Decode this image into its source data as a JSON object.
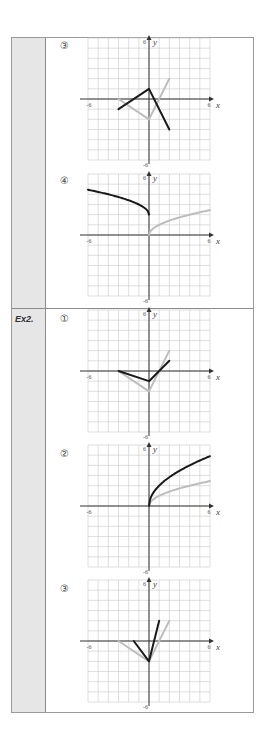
{
  "rows": [
    {
      "label": "",
      "problems": [
        {
          "number": "③",
          "graph_index": 0
        },
        {
          "number": "④",
          "graph_index": 1
        }
      ]
    },
    {
      "label": "Ex2.",
      "problems": [
        {
          "number": "①",
          "graph_index": 2
        },
        {
          "number": "②",
          "graph_index": 3
        },
        {
          "number": "③",
          "graph_index": 4
        }
      ]
    }
  ],
  "axis": {
    "min_label": "-6",
    "max_label": "6",
    "x_label": "x",
    "y_label": "y"
  },
  "colors": {
    "transformed": "#1a1a1a",
    "original": "#bdbdbd",
    "grid": "#c9c9c9",
    "label_bg": "#e6e6e6"
  },
  "chart_data": [
    {
      "type": "line",
      "title": "③",
      "xlim": [
        -6,
        6
      ],
      "ylim": [
        -6,
        6
      ],
      "grid": true,
      "xlabel": "x",
      "ylabel": "y",
      "series": [
        {
          "name": "transformed",
          "color": "#1a1a1a",
          "points": [
            [
              -3,
              -1
            ],
            [
              0,
              1
            ],
            [
              2,
              -3
            ]
          ]
        },
        {
          "name": "original",
          "color": "#bdbdbd",
          "points": [
            [
              -3,
              0
            ],
            [
              0,
              -2
            ],
            [
              1,
              0
            ],
            [
              2,
              2
            ]
          ]
        }
      ]
    },
    {
      "type": "line",
      "title": "④",
      "xlim": [
        -6,
        6
      ],
      "ylim": [
        -6,
        6
      ],
      "grid": true,
      "xlabel": "x",
      "ylabel": "y",
      "series": [
        {
          "name": "transformed",
          "color": "#1a1a1a",
          "function": "y = sqrt(-x) + 2",
          "domain": [
            -6,
            0
          ],
          "points": [
            [
              -6,
              4.45
            ],
            [
              -5,
              4.24
            ],
            [
              -4,
              4
            ],
            [
              -3,
              3.73
            ],
            [
              -2,
              3.41
            ],
            [
              -1,
              3
            ],
            [
              -0.5,
              2.71
            ],
            [
              -0.1,
              2.32
            ],
            [
              0,
              2
            ]
          ]
        },
        {
          "name": "original",
          "color": "#bdbdbd",
          "function": "y = sqrt(x)",
          "domain": [
            0,
            6
          ],
          "points": [
            [
              0,
              0
            ],
            [
              0.1,
              0.32
            ],
            [
              0.5,
              0.71
            ],
            [
              1,
              1
            ],
            [
              2,
              1.41
            ],
            [
              3,
              1.73
            ],
            [
              4,
              2
            ],
            [
              5,
              2.24
            ],
            [
              6,
              2.45
            ]
          ]
        }
      ]
    },
    {
      "type": "line",
      "title": "Ex2. ①",
      "xlim": [
        -6,
        6
      ],
      "ylim": [
        -6,
        6
      ],
      "grid": true,
      "xlabel": "x",
      "ylabel": "y",
      "series": [
        {
          "name": "transformed",
          "color": "#1a1a1a",
          "points": [
            [
              -3,
              0
            ],
            [
              0,
              -1
            ],
            [
              2,
              1
            ]
          ]
        },
        {
          "name": "original",
          "color": "#bdbdbd",
          "points": [
            [
              -3,
              0
            ],
            [
              0,
              -2
            ],
            [
              2,
              2
            ]
          ]
        }
      ]
    },
    {
      "type": "line",
      "title": "Ex2. ②",
      "xlim": [
        -6,
        6
      ],
      "ylim": [
        -6,
        6
      ],
      "grid": true,
      "xlabel": "x",
      "ylabel": "y",
      "series": [
        {
          "name": "transformed",
          "color": "#1a1a1a",
          "function": "y = 2*sqrt(x)",
          "domain": [
            0,
            6
          ],
          "points": [
            [
              0,
              0
            ],
            [
              0.1,
              0.63
            ],
            [
              0.5,
              1.41
            ],
            [
              1,
              2
            ],
            [
              2,
              2.83
            ],
            [
              3,
              3.46
            ],
            [
              4,
              4
            ],
            [
              5,
              4.47
            ],
            [
              6,
              4.9
            ]
          ]
        },
        {
          "name": "original",
          "color": "#bdbdbd",
          "function": "y = sqrt(x)",
          "domain": [
            0,
            6
          ],
          "points": [
            [
              0,
              0
            ],
            [
              0.1,
              0.32
            ],
            [
              0.5,
              0.71
            ],
            [
              1,
              1
            ],
            [
              2,
              1.41
            ],
            [
              3,
              1.73
            ],
            [
              4,
              2
            ],
            [
              5,
              2.24
            ],
            [
              6,
              2.45
            ]
          ]
        }
      ]
    },
    {
      "type": "line",
      "title": "Ex2. ③",
      "xlim": [
        -6,
        6
      ],
      "ylim": [
        -6,
        6
      ],
      "grid": true,
      "xlabel": "x",
      "ylabel": "y",
      "series": [
        {
          "name": "transformed",
          "color": "#1a1a1a",
          "points": [
            [
              -1.5,
              0
            ],
            [
              0,
              -2
            ],
            [
              1,
              2
            ]
          ]
        },
        {
          "name": "original",
          "color": "#bdbdbd",
          "points": [
            [
              -3,
              0
            ],
            [
              0,
              -2
            ],
            [
              2,
              2
            ]
          ]
        }
      ]
    }
  ]
}
